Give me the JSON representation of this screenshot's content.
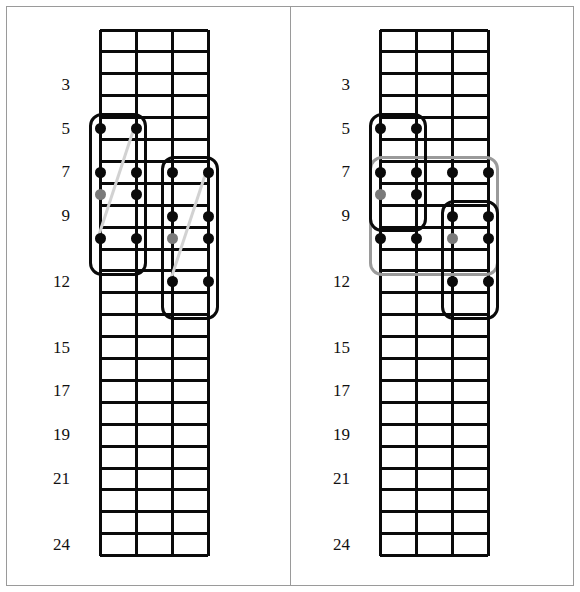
{
  "meta": {
    "panels": 2,
    "strings": 4,
    "frets": 24,
    "colors": {
      "line": "#0a0a0a",
      "note": "#0a0a0a",
      "root_note": "#7a7a7a",
      "box_black": "#0a0a0a",
      "box_grey": "#9a9a9a",
      "slide": "#d2d2d2",
      "frame": "#9a9a9a",
      "background": "#ffffff"
    }
  },
  "fret_labels": [
    "3",
    "5",
    "7",
    "9",
    "12",
    "15",
    "17",
    "19",
    "21",
    "24"
  ],
  "panels": [
    {
      "id": "left-diagram",
      "name": "left-fretboard",
      "labels": [
        {
          "text": "3",
          "fret": 3
        },
        {
          "text": "5",
          "fret": 5
        },
        {
          "text": "7",
          "fret": 7
        },
        {
          "text": "9",
          "fret": 9
        },
        {
          "text": "12",
          "fret": 12
        },
        {
          "text": "15",
          "fret": 15
        },
        {
          "text": "17",
          "fret": 17
        },
        {
          "text": "19",
          "fret": 19
        },
        {
          "text": "21",
          "fret": 21
        },
        {
          "text": "24",
          "fret": 24
        }
      ],
      "notes": [
        {
          "string": 1,
          "fret": 5,
          "type": "note"
        },
        {
          "string": 2,
          "fret": 5,
          "type": "note"
        },
        {
          "string": 1,
          "fret": 7,
          "type": "note"
        },
        {
          "string": 2,
          "fret": 7,
          "type": "note"
        },
        {
          "string": 1,
          "fret": 8,
          "type": "root"
        },
        {
          "string": 2,
          "fret": 8,
          "type": "note"
        },
        {
          "string": 1,
          "fret": 10,
          "type": "note"
        },
        {
          "string": 2,
          "fret": 10,
          "type": "note"
        },
        {
          "string": 3,
          "fret": 7,
          "type": "note"
        },
        {
          "string": 4,
          "fret": 7,
          "type": "note"
        },
        {
          "string": 3,
          "fret": 9,
          "type": "note"
        },
        {
          "string": 4,
          "fret": 9,
          "type": "note"
        },
        {
          "string": 3,
          "fret": 10,
          "type": "root"
        },
        {
          "string": 4,
          "fret": 10,
          "type": "note"
        },
        {
          "string": 3,
          "fret": 12,
          "type": "note"
        },
        {
          "string": 4,
          "fret": 12,
          "type": "note"
        }
      ],
      "boxes": [
        {
          "name": "position-box-lower",
          "color": "black",
          "string_from": 1,
          "string_to": 2,
          "fret_from": 4,
          "fret_to": 11
        },
        {
          "name": "position-box-upper",
          "color": "black",
          "string_from": 3,
          "string_to": 4,
          "fret_from": 6,
          "fret_to": 13
        }
      ],
      "slides": [
        {
          "name": "slide-line-1",
          "from": {
            "string": 2,
            "fret": 5
          },
          "to": {
            "string": 1,
            "fret": 10
          }
        },
        {
          "name": "slide-line-2",
          "from": {
            "string": 4,
            "fret": 7
          },
          "to": {
            "string": 3,
            "fret": 12
          }
        }
      ]
    },
    {
      "id": "right-diagram",
      "name": "right-fretboard",
      "labels": [
        {
          "text": "3",
          "fret": 3
        },
        {
          "text": "5",
          "fret": 5
        },
        {
          "text": "7",
          "fret": 7
        },
        {
          "text": "9",
          "fret": 9
        },
        {
          "text": "12",
          "fret": 12
        },
        {
          "text": "15",
          "fret": 15
        },
        {
          "text": "17",
          "fret": 17
        },
        {
          "text": "19",
          "fret": 19
        },
        {
          "text": "21",
          "fret": 21
        },
        {
          "text": "24",
          "fret": 24
        }
      ],
      "notes": [
        {
          "string": 1,
          "fret": 5,
          "type": "note"
        },
        {
          "string": 2,
          "fret": 5,
          "type": "note"
        },
        {
          "string": 1,
          "fret": 7,
          "type": "note"
        },
        {
          "string": 2,
          "fret": 7,
          "type": "note"
        },
        {
          "string": 1,
          "fret": 8,
          "type": "root"
        },
        {
          "string": 2,
          "fret": 8,
          "type": "note"
        },
        {
          "string": 1,
          "fret": 10,
          "type": "note"
        },
        {
          "string": 2,
          "fret": 10,
          "type": "note"
        },
        {
          "string": 3,
          "fret": 7,
          "type": "note"
        },
        {
          "string": 4,
          "fret": 7,
          "type": "note"
        },
        {
          "string": 3,
          "fret": 9,
          "type": "note"
        },
        {
          "string": 4,
          "fret": 9,
          "type": "note"
        },
        {
          "string": 3,
          "fret": 10,
          "type": "root"
        },
        {
          "string": 4,
          "fret": 10,
          "type": "note"
        },
        {
          "string": 3,
          "fret": 12,
          "type": "note"
        },
        {
          "string": 4,
          "fret": 12,
          "type": "note"
        }
      ],
      "boxes": [
        {
          "name": "position-box-lower",
          "color": "black",
          "string_from": 1,
          "string_to": 2,
          "fret_from": 4,
          "fret_to": 9
        },
        {
          "name": "position-box-upper",
          "color": "black",
          "string_from": 3,
          "string_to": 4,
          "fret_from": 8,
          "fret_to": 13
        },
        {
          "name": "position-box-span",
          "color": "grey",
          "string_from": 1,
          "string_to": 4,
          "fret_from": 6,
          "fret_to": 11
        }
      ],
      "slides": []
    }
  ]
}
